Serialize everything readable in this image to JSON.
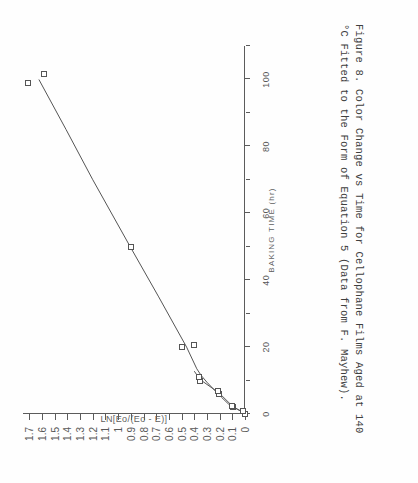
{
  "figure": {
    "label": "Figure 8.",
    "caption_line_1": "Figure 8.   Color Change vs Time for Cellophane Films Aged at 140",
    "caption_line_2": "°C Fitted to the Form of Equation 5 (Data from F. Mayhew).",
    "caption_full": "Figure 8.  Color Change vs Time for Cellophane Films Aged at 140 °C Fitted to the Form of Equation 5 (Data from F. Mayhew)."
  },
  "chart_data": {
    "type": "scatter",
    "title": "",
    "subtitle": "",
    "xlabel": "BAKING TIME  (hr)",
    "ylabel": "LN[Eo/(Eo - E)]",
    "xlim": [
      0,
      110
    ],
    "ylim": [
      0,
      1.75
    ],
    "grid": false,
    "legend": "none",
    "x_ticks_major": [
      0,
      20,
      40,
      60,
      80,
      100
    ],
    "x_tick_labels": [
      "0",
      "20",
      "40",
      "60",
      "80",
      "100"
    ],
    "x_ticks_minor": [
      10,
      30,
      50,
      70,
      90,
      110
    ],
    "y_ticks": [
      0,
      0.1,
      0.2,
      0.3,
      0.4,
      0.5,
      0.6,
      0.7,
      0.8,
      0.9,
      1,
      1.1,
      1.2,
      1.3,
      1.4,
      1.5,
      1.6,
      1.7
    ],
    "y_tick_labels": [
      "0",
      "0.1",
      "0.2",
      "0.3",
      "0.4",
      "0.5",
      "0.6",
      "0.7",
      "0.8",
      "0.9",
      "1",
      "1.1",
      "1.2",
      "1.3",
      "1.4",
      "1.5",
      "1.6",
      "1.7"
    ],
    "marker": "open-square",
    "series": [
      {
        "name": "Measured color change",
        "points": [
          {
            "x": 0.0,
            "y": 0.0
          },
          {
            "x": 1.0,
            "y": 0.015
          },
          {
            "x": 2.0,
            "y": 0.095
          },
          {
            "x": 2.5,
            "y": 0.105
          },
          {
            "x": 6.0,
            "y": 0.205
          },
          {
            "x": 6.8,
            "y": 0.21
          },
          {
            "x": 10.0,
            "y": 0.355
          },
          {
            "x": 11.0,
            "y": 0.365
          },
          {
            "x": 20.0,
            "y": 0.5
          },
          {
            "x": 20.5,
            "y": 0.4
          },
          {
            "x": 50.0,
            "y": 0.9
          },
          {
            "x": 99.0,
            "y": 1.71
          },
          {
            "x": 101.5,
            "y": 1.585
          }
        ]
      },
      {
        "name": "Equation 5 fit",
        "type": "line",
        "points": [
          {
            "x": 0.2,
            "y": 0.0
          },
          {
            "x": 1.4,
            "y": 0.06
          },
          {
            "x": 3.0,
            "y": 0.13
          },
          {
            "x": 5.0,
            "y": 0.185
          },
          {
            "x": 7.5,
            "y": 0.25
          },
          {
            "x": 9.5,
            "y": 0.3
          },
          {
            "x": 11.5,
            "y": 0.345
          },
          {
            "x": 13.5,
            "y": 0.38
          },
          {
            "x": 20.0,
            "y": 0.46
          },
          {
            "x": 35.0,
            "y": 0.68
          },
          {
            "x": 50.0,
            "y": 0.905
          },
          {
            "x": 70.0,
            "y": 1.2
          },
          {
            "x": 85.0,
            "y": 1.41
          },
          {
            "x": 100.0,
            "y": 1.625
          }
        ]
      },
      {
        "name": "Low-time branch",
        "type": "line",
        "points": [
          {
            "x": 0.3,
            "y": 0.005
          },
          {
            "x": 2.2,
            "y": 0.095
          },
          {
            "x": 6.3,
            "y": 0.205
          },
          {
            "x": 10.3,
            "y": 0.355
          },
          {
            "x": 12.8,
            "y": 0.4
          }
        ]
      }
    ]
  },
  "colors": {
    "ink": "#555555",
    "axis": "#5b5b5b",
    "label": "#585858",
    "paper": "#fefefe"
  }
}
